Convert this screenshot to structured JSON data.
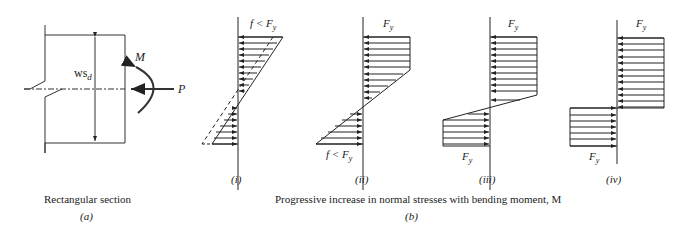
{
  "part_a": {
    "caption": "Rectangular section",
    "label": "(a)",
    "moment_label": "M",
    "force_label": "P",
    "dimension_label": "ws",
    "dimension_sub": "d"
  },
  "part_b": {
    "caption": "Progressive increase in normal stresses with bending moment, M",
    "label": "(b)",
    "diagrams": [
      {
        "label": "(i)",
        "top_text": "f < F",
        "top_sub": "y",
        "bottom_text": ""
      },
      {
        "label": "(ii)",
        "top_text": "F",
        "top_sub": "y",
        "bottom_text": "f < F",
        "bottom_sub": "y"
      },
      {
        "label": "(iii)",
        "top_text": "F",
        "top_sub": "y",
        "bottom_text": "F",
        "bottom_sub": "y"
      },
      {
        "label": "(iv)",
        "top_text": "F",
        "top_sub": "y",
        "bottom_text": "F",
        "bottom_sub": "y"
      }
    ]
  }
}
